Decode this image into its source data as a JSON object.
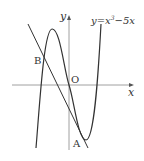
{
  "figure": {
    "equation_label": "y=x³−5x",
    "equation_prefix": "y=x",
    "equation_exponent": "3",
    "equation_suffix": "−5x",
    "axis_x_label": "x",
    "axis_y_label": "y",
    "origin_label": "O",
    "point_a_label": "A",
    "point_b_label": "B",
    "colors": {
      "stroke": "#333333",
      "axis": "#888888",
      "background": "#ffffff"
    }
  }
}
